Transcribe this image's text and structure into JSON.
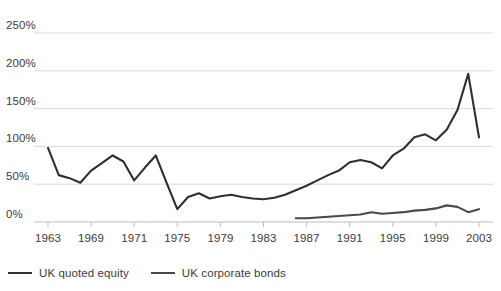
{
  "chart_data": {
    "type": "line",
    "title": "",
    "subtitle": "",
    "xlabel": "",
    "ylabel": "",
    "ylim": [
      0,
      250
    ],
    "xlim": [
      1963,
      2003
    ],
    "grid": true,
    "grid_axis": "y",
    "legend_position": "bottom-left",
    "y_ticks": [
      0,
      50,
      100,
      150,
      200,
      250
    ],
    "y_tick_labels": [
      "0%",
      "50%",
      "100%",
      "150%",
      "200%",
      "250%"
    ],
    "x_ticks": [
      1963,
      1967,
      1971,
      1975,
      1979,
      1983,
      1987,
      1991,
      1995,
      1999,
      2003
    ],
    "x_tick_labels": [
      "1963",
      "1969",
      "1971",
      "1975",
      "1979",
      "1983",
      "1987",
      "1991",
      "1995",
      "1999",
      "2003"
    ],
    "series": [
      {
        "name": "UK quoted equity",
        "color": "#2f2f2f",
        "x": [
          1963,
          1964,
          1965,
          1966,
          1967,
          1968,
          1969,
          1970,
          1971,
          1972,
          1973,
          1974,
          1975,
          1976,
          1977,
          1978,
          1979,
          1980,
          1981,
          1982,
          1983,
          1984,
          1985,
          1986,
          1987,
          1988,
          1989,
          1990,
          1991,
          1992,
          1993,
          1994,
          1995,
          1996,
          1997,
          1998,
          1999,
          2000,
          2001,
          2002,
          2003
        ],
        "values": [
          98,
          62,
          58,
          52,
          68,
          78,
          88,
          80,
          55,
          72,
          88,
          52,
          17,
          33,
          38,
          31,
          34,
          36,
          33,
          31,
          30,
          32,
          36,
          42,
          48,
          55,
          62,
          68,
          79,
          82,
          79,
          71,
          88,
          97,
          112,
          116,
          108,
          122,
          148,
          196,
          112
        ],
        "values_note": "percent of GDP"
      },
      {
        "name": "UK corporate bonds",
        "color": "#4a4a4a",
        "x": [
          1986,
          1987,
          1988,
          1989,
          1990,
          1991,
          1992,
          1993,
          1994,
          1995,
          1996,
          1997,
          1998,
          1999,
          2000,
          2001,
          2002,
          2003
        ],
        "values": [
          5,
          5,
          6,
          7,
          8,
          9,
          10,
          13,
          11,
          12,
          13,
          15,
          16,
          18,
          22,
          20,
          13,
          17
        ],
        "values_note": "percent of GDP"
      }
    ]
  },
  "axes": {
    "y_labels": [
      "250%",
      "200%",
      "150%",
      "100%",
      "50%",
      "0%"
    ],
    "x_labels": [
      "1963",
      "1969",
      "1971",
      "1975",
      "1979",
      "1983",
      "1987",
      "1991",
      "1995",
      "1999",
      "2003"
    ]
  },
  "legend": {
    "items": [
      {
        "label": "UK quoted equity",
        "color": "#2f2f2f"
      },
      {
        "label": "UK corporate bonds",
        "color": "#4a4a4a"
      }
    ]
  },
  "colors": {
    "background": "#ffffff",
    "gridline": "#d9d9d9",
    "axis": "#bdbdbd",
    "text": "#3b3b3b",
    "equity_line": "#2f2f2f",
    "bonds_line": "#4a4a4a"
  }
}
